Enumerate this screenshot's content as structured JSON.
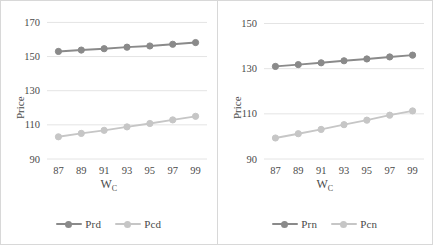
{
  "figure": {
    "background": "#ffffff",
    "panel_border_color": "#d8d8d8"
  },
  "chart_data": [
    {
      "type": "line",
      "id": "left-panel",
      "title": "",
      "xlabel": "W_C",
      "xlabel_base": "W",
      "xlabel_sub": "C",
      "ylabel": "Price",
      "x": [
        87,
        89,
        91,
        93,
        95,
        97,
        99
      ],
      "xticklabels": [
        "87",
        "89",
        "91",
        "93",
        "95",
        "97",
        "99"
      ],
      "xlim": [
        86,
        100
      ],
      "ylim": [
        90,
        172
      ],
      "yticks": [
        90,
        110,
        130,
        150,
        170
      ],
      "yticklabels": [
        "90",
        "110",
        "130",
        "150",
        "170"
      ],
      "grid": true,
      "grid_axis": "y",
      "legend_position": "bottom",
      "series": [
        {
          "name": "Prd",
          "color": "#8a8a8a",
          "marker": "circle",
          "values": [
            153.0,
            153.8,
            154.6,
            155.5,
            156.2,
            157.2,
            158.2
          ]
        },
        {
          "name": "Pcd",
          "color": "#c6c6c6",
          "marker": "circle",
          "values": [
            103.0,
            105.0,
            106.8,
            108.8,
            110.8,
            112.9,
            115.0
          ]
        }
      ]
    },
    {
      "type": "line",
      "id": "right-panel",
      "title": "",
      "xlabel": "W_C",
      "xlabel_base": "W",
      "xlabel_sub": "C",
      "ylabel": "Price",
      "x": [
        87,
        89,
        91,
        93,
        95,
        97,
        99
      ],
      "xticklabels": [
        "87",
        "89",
        "91",
        "93",
        "95",
        "97",
        "99"
      ],
      "xlim": [
        86,
        100
      ],
      "ylim": [
        90,
        152
      ],
      "yticks": [
        90,
        110,
        130,
        150
      ],
      "yticklabels": [
        "90",
        "110",
        "130",
        "150"
      ],
      "grid": true,
      "grid_axis": "y",
      "legend_position": "bottom",
      "series": [
        {
          "name": "Prn",
          "color": "#8a8a8a",
          "marker": "circle",
          "values": [
            131.0,
            131.8,
            132.6,
            133.5,
            134.3,
            135.2,
            136.0
          ]
        },
        {
          "name": "Pcn",
          "color": "#c6c6c6",
          "marker": "circle",
          "values": [
            99.3,
            101.2,
            103.1,
            105.2,
            107.2,
            109.4,
            111.3
          ]
        }
      ]
    }
  ],
  "left": {
    "ylabel": "Price",
    "xlabel_base": "W",
    "xlabel_sub": "C",
    "legend": [
      {
        "label": "Prd",
        "color": "#8a8a8a"
      },
      {
        "label": "Pcd",
        "color": "#c6c6c6"
      }
    ]
  },
  "right": {
    "ylabel": "Price",
    "xlabel_base": "W",
    "xlabel_sub": "C",
    "legend": [
      {
        "label": "Prn",
        "color": "#8a8a8a"
      },
      {
        "label": "Pcn",
        "color": "#c6c6c6"
      }
    ]
  }
}
